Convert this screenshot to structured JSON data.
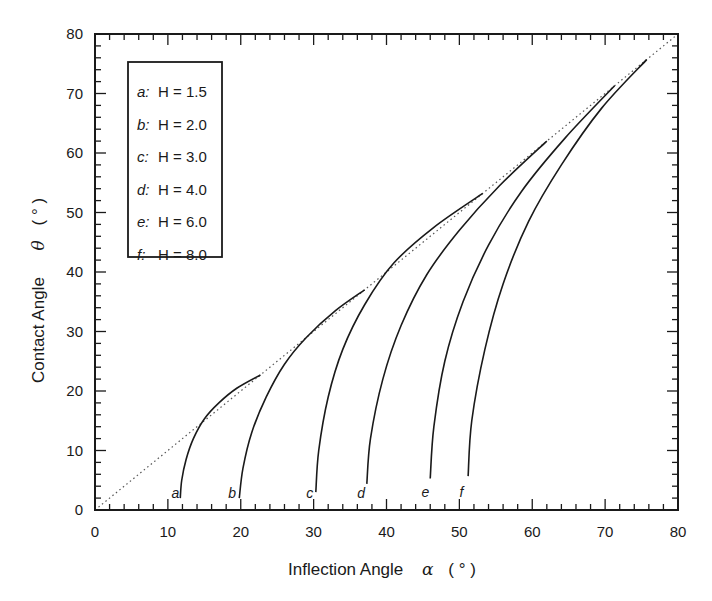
{
  "chart_data": {
    "type": "line",
    "title": "",
    "xlabel": "Inflection Angle",
    "xlabel_symbol": "α",
    "xlabel_unit": "( ° )",
    "ylabel": "Contact Angle",
    "ylabel_symbol": "θ",
    "ylabel_unit": "( ° )",
    "xlim": [
      0,
      80
    ],
    "ylim": [
      0,
      80
    ],
    "xticks": [
      0,
      10,
      20,
      30,
      40,
      50,
      60,
      70,
      80
    ],
    "yticks": [
      0,
      10,
      20,
      30,
      40,
      50,
      60,
      70,
      80
    ],
    "minor_tick_step": 2,
    "grid": false,
    "legend_position": "upper-left",
    "reference_line": {
      "name": "θ = α",
      "style": "dotted",
      "x": [
        0,
        80
      ],
      "y": [
        0,
        80
      ]
    },
    "series": [
      {
        "id": "a",
        "name": "a: H = 1.5",
        "label": "a",
        "H": "1.5",
        "x": [
          11.7,
          11.9,
          12.5,
          13.5,
          15.0,
          17.0,
          19.5,
          22.7
        ],
        "y": [
          2.0,
          5.0,
          8.5,
          12.0,
          15.3,
          18.0,
          20.5,
          22.7
        ]
      },
      {
        "id": "b",
        "name": "b: H = 2.0",
        "label": "b",
        "H": "2.0",
        "x": [
          19.8,
          20.3,
          21.5,
          23.5,
          26.0,
          29.0,
          33.0,
          37.0
        ],
        "y": [
          2.0,
          7.0,
          13.0,
          19.0,
          24.5,
          29.0,
          33.5,
          37.0
        ]
      },
      {
        "id": "c",
        "name": "c: H = 3.0",
        "label": "c",
        "H": "3.0",
        "x": [
          30.3,
          30.7,
          32.0,
          34.0,
          37.0,
          41.0,
          46.5,
          53.2
        ],
        "y": [
          3.0,
          10.0,
          19.0,
          27.0,
          34.5,
          41.5,
          47.5,
          53.2
        ]
      },
      {
        "id": "d",
        "name": "d: H = 4.0",
        "label": "d",
        "H": "4.0",
        "x": [
          37.3,
          37.8,
          39.5,
          42.0,
          45.5,
          50.0,
          55.5,
          62.0
        ],
        "y": [
          4.4,
          12.0,
          22.0,
          31.0,
          39.5,
          47.0,
          54.5,
          62.0
        ]
      },
      {
        "id": "e",
        "name": "e: H = 6.0",
        "label": "e",
        "H": "6.0",
        "x": [
          46.0,
          46.5,
          48.0,
          50.5,
          54.0,
          58.5,
          64.5,
          71.3
        ],
        "y": [
          5.3,
          14.0,
          25.0,
          35.0,
          44.5,
          53.5,
          62.5,
          71.3
        ]
      },
      {
        "id": "f",
        "name": "f: H = 8.0",
        "label": "f",
        "H": "8.0",
        "x": [
          51.2,
          51.7,
          53.5,
          56.0,
          59.5,
          64.0,
          69.5,
          75.7
        ],
        "y": [
          5.7,
          15.0,
          27.0,
          38.0,
          48.5,
          58.0,
          67.5,
          75.7
        ]
      }
    ],
    "curve_label_positions": [
      {
        "label": "a",
        "x": 10.5,
        "y": 2.0
      },
      {
        "label": "b",
        "x": 18.3,
        "y": 2.0
      },
      {
        "label": "c",
        "x": 29.0,
        "y": 2.0
      },
      {
        "label": "d",
        "x": 36.0,
        "y": 2.0
      },
      {
        "label": "e",
        "x": 44.8,
        "y": 2.2
      },
      {
        "label": "f",
        "x": 50.0,
        "y": 2.2
      }
    ]
  },
  "legend": {
    "items": [
      {
        "key": "a",
        "text": "H = 1.5"
      },
      {
        "key": "b",
        "text": "H = 2.0"
      },
      {
        "key": "c",
        "text": "H = 3.0"
      },
      {
        "key": "d",
        "text": "H = 4.0"
      },
      {
        "key": "e",
        "text": "H = 6.0"
      },
      {
        "key": "f",
        "text": "H = 8.0"
      }
    ]
  },
  "colors": {
    "ink": "#1a1a1a",
    "background": "#ffffff",
    "reference_line": "#555555"
  }
}
